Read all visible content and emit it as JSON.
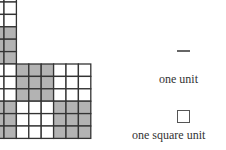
{
  "diagram": {
    "cell_size_px": 12.4,
    "colors": {
      "shaded": "#b3b3b3",
      "unshaded": "#ffffff",
      "line": "#333333"
    },
    "column_region": {
      "cols": 2,
      "rows_white": 3,
      "rows_shaded": 3
    },
    "block_region": {
      "cols": 7,
      "rows": 6,
      "pattern": [
        [
          0,
          1,
          1,
          1,
          0,
          0,
          0
        ],
        [
          0,
          1,
          1,
          1,
          0,
          0,
          0
        ],
        [
          0,
          1,
          1,
          1,
          0,
          0,
          0
        ],
        [
          1,
          0,
          0,
          0,
          1,
          1,
          1
        ],
        [
          1,
          0,
          0,
          0,
          1,
          1,
          1
        ],
        [
          1,
          0,
          0,
          0,
          1,
          1,
          1
        ]
      ]
    }
  },
  "legend": {
    "unit_label": "one unit",
    "square_unit_label": "one square unit"
  }
}
